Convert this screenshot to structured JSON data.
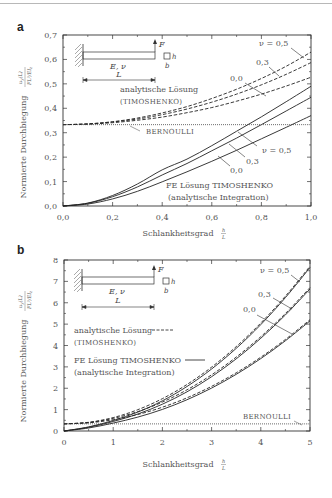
{
  "chart_data": [
    {
      "panel": "a",
      "type": "line",
      "xlabel": "Schlankheitsgrad h/L",
      "ylabel": "Normierte Durchbiegung u_y(L) / (F L^3 / (E I_z))",
      "xlim": [
        0.0,
        1.0
      ],
      "ylim": [
        0.0,
        0.7
      ],
      "xticks": [
        "0,0",
        "0,2",
        "0,4",
        "0,6",
        "0,8",
        "1,0"
      ],
      "yticks": [
        "0,0",
        "0,1",
        "0,2",
        "0,3",
        "0,4",
        "0,5",
        "0,6",
        "0,7"
      ],
      "grid": false,
      "x": [
        0.0,
        0.1,
        0.2,
        0.3,
        0.4,
        0.5,
        0.6,
        0.7,
        0.8,
        0.9,
        1.0
      ],
      "series": [
        {
          "name": "analytische Lösung (Timoshenko) ν=0,5",
          "style": "dashed",
          "values": [
            0.333,
            0.336,
            0.345,
            0.36,
            0.381,
            0.407,
            0.44,
            0.478,
            0.522,
            0.572,
            0.63
          ]
        },
        {
          "name": "analytische Lösung (Timoshenko) ν=0,3",
          "style": "dashed",
          "values": [
            0.333,
            0.336,
            0.344,
            0.356,
            0.374,
            0.397,
            0.425,
            0.458,
            0.496,
            0.539,
            0.587
          ]
        },
        {
          "name": "analytische Lösung (Timoshenko) ν=0,0",
          "style": "dashed",
          "values": [
            0.333,
            0.335,
            0.341,
            0.351,
            0.364,
            0.382,
            0.403,
            0.429,
            0.458,
            0.491,
            0.527
          ]
        },
        {
          "name": "FE Lösung Timoshenko (analytische Integration) ν=0,5",
          "style": "solid",
          "values": [
            0.0,
            0.012,
            0.043,
            0.09,
            0.148,
            0.192,
            0.247,
            0.306,
            0.365,
            0.427,
            0.49
          ]
        },
        {
          "name": "FE Lösung Timoshenko (analytische Integration) ν=0,3",
          "style": "solid",
          "values": [
            0.0,
            0.011,
            0.038,
            0.078,
            0.127,
            0.174,
            0.226,
            0.278,
            0.333,
            0.389,
            0.445
          ]
        },
        {
          "name": "FE Lösung Timoshenko (analytische Integration) ν=0,0",
          "style": "solid",
          "values": [
            0.0,
            0.008,
            0.029,
            0.06,
            0.099,
            0.14,
            0.183,
            0.228,
            0.275,
            0.322,
            0.37
          ]
        },
        {
          "name": "Bernoulli",
          "style": "dotted",
          "values": [
            0.333,
            0.333,
            0.333,
            0.333,
            0.333,
            0.333,
            0.333,
            0.333,
            0.333,
            0.333,
            0.333
          ]
        }
      ],
      "annotations": [
        "ν = 0,5",
        "0,3",
        "0,0",
        "ν = 0,5",
        "0,3",
        "0,0",
        "analytische Lösung",
        "(Timoshenko)",
        "Bernoulli",
        "FE Lösung Timoshenko",
        "(analytische Integration)"
      ]
    },
    {
      "panel": "b",
      "type": "line",
      "xlabel": "Schlankheitsgrad h/L",
      "ylabel": "Normierte Durchbiegung u_y(L) / (F L^3 / (E I_z))",
      "xlim": [
        0,
        5
      ],
      "ylim": [
        0,
        8
      ],
      "xticks": [
        "0",
        "1",
        "2",
        "3",
        "4",
        "5"
      ],
      "yticks": [
        "0",
        "1",
        "2",
        "3",
        "4",
        "5",
        "6",
        "7",
        "8"
      ],
      "grid": false,
      "x": [
        0,
        0.5,
        1,
        1.5,
        2,
        2.5,
        3,
        3.5,
        4,
        4.5,
        5
      ],
      "series": [
        {
          "name": "analytische Lösung (Timoshenko) ν=0,5",
          "style": "dashed",
          "values": [
            0.333,
            0.407,
            0.628,
            0.997,
            1.513,
            2.177,
            2.988,
            3.947,
            5.053,
            6.307,
            7.708
          ]
        },
        {
          "name": "analytische Lösung (Timoshenko) ν=0,3",
          "style": "dashed",
          "values": [
            0.333,
            0.397,
            0.588,
            0.907,
            1.353,
            1.927,
            2.628,
            3.457,
            4.413,
            5.497,
            6.708
          ]
        },
        {
          "name": "analytische Lösung (Timoshenko) ν=0,0",
          "style": "dashed",
          "values": [
            0.333,
            0.382,
            0.528,
            0.772,
            1.113,
            1.552,
            2.088,
            2.722,
            3.453,
            4.282,
            5.208
          ]
        },
        {
          "name": "FE Lösung Timoshenko ν=0,5",
          "style": "solid",
          "values": [
            0.0,
            0.192,
            0.49,
            0.885,
            1.412,
            2.083,
            2.9,
            3.865,
            4.978,
            6.24,
            7.65
          ]
        },
        {
          "name": "FE Lösung Timoshenko ν=0,3",
          "style": "solid",
          "values": [
            0.0,
            0.174,
            0.445,
            0.794,
            1.254,
            1.833,
            2.54,
            3.375,
            4.338,
            5.429,
            6.645
          ]
        },
        {
          "name": "FE Lösung Timoshenko ν=0,0",
          "style": "solid",
          "values": [
            0.0,
            0.14,
            0.37,
            0.65,
            1.01,
            1.462,
            2.008,
            2.65,
            3.388,
            4.222,
            5.15
          ]
        },
        {
          "name": "Bernoulli",
          "style": "dotted",
          "values": [
            0.333,
            0.333,
            0.333,
            0.333,
            0.333,
            0.333,
            0.333,
            0.333,
            0.333,
            0.333,
            0.333
          ]
        }
      ],
      "annotations": [
        "ν = 0,5",
        "0,3",
        "0,0",
        "analytische Lösung",
        "(Timoshenko)",
        "FE Lösung Timoshenko",
        "(analytische Integration)",
        "Bernoulli"
      ]
    }
  ],
  "figure": {
    "panel_a_label": "a",
    "panel_b_label": "b",
    "ylabel_text": "Normierte Durchbiegung",
    "xlabel_text": "Schlankheitsgrad",
    "frac_h": "h",
    "frac_L": "L",
    "inset": {
      "force": "F",
      "material": "E, ν",
      "length": "L",
      "height": "h",
      "width": "b"
    },
    "a": {
      "nu05_dash": "ν = 0,5",
      "nu03_dash": "0,3",
      "nu00_dash": "0,0",
      "nu05_solid": "ν = 0,5",
      "nu03_solid": "0,3",
      "nu00_solid": "0,0",
      "analytic_1": "analytische Lösung",
      "analytic_2": "(TIMOSHENKO)",
      "bernoulli": "BERNOULLI",
      "fe_1": "FE Lösung TIMOSHENKO",
      "fe_2": "(analytische Integration)"
    },
    "b": {
      "nu05": "ν = 0,5",
      "nu03": "0,3",
      "nu00": "0,0",
      "analytic_1": "analytische Lösung",
      "analytic_2": "(TIMOSHENKO)",
      "fe_1": "FE Lösung TIMOSHENKO",
      "fe_2": "(analytische Integration)",
      "bernoulli": "BERNOULLI"
    }
  }
}
